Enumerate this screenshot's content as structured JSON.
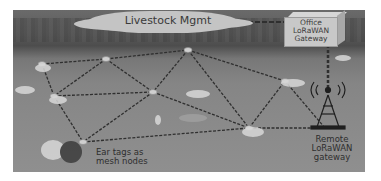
{
  "diagram": {
    "cloud_label": "Livestock Mgmt",
    "office_gateway": {
      "line1": "Office",
      "line2": "LoRaWAN",
      "line3": "Gateway"
    },
    "remote_gateway": {
      "line1": "Remote",
      "line2": "LoRaWAN",
      "line3": "gateway"
    },
    "ear_tags": {
      "line1": "Ear tags as",
      "line2": "mesh nodes"
    },
    "nodes": [
      {
        "id": "A",
        "x": 29,
        "y": 54
      },
      {
        "id": "B",
        "x": 93,
        "y": 49
      },
      {
        "id": "C",
        "x": 175,
        "y": 40
      },
      {
        "id": "D",
        "x": 272,
        "y": 71
      },
      {
        "id": "E",
        "x": 41,
        "y": 86
      },
      {
        "id": "F",
        "x": 140,
        "y": 82
      },
      {
        "id": "G",
        "x": 236,
        "y": 118
      },
      {
        "id": "H",
        "x": 70,
        "y": 132
      },
      {
        "id": "T",
        "x": 312,
        "y": 118
      }
    ],
    "links": [
      [
        "A",
        "B"
      ],
      [
        "B",
        "C"
      ],
      [
        "C",
        "D"
      ],
      [
        "A",
        "E"
      ],
      [
        "B",
        "E"
      ],
      [
        "B",
        "F"
      ],
      [
        "C",
        "F"
      ],
      [
        "C",
        "G"
      ],
      [
        "E",
        "F"
      ],
      [
        "F",
        "G"
      ],
      [
        "E",
        "H"
      ],
      [
        "F",
        "H"
      ],
      [
        "H",
        "G"
      ],
      [
        "G",
        "D"
      ],
      [
        "D",
        "T"
      ],
      [
        "G",
        "T"
      ]
    ],
    "colors": {
      "line": "#2f2f2f",
      "node": "#cfcfcf",
      "label": "#2e2e2e"
    }
  }
}
